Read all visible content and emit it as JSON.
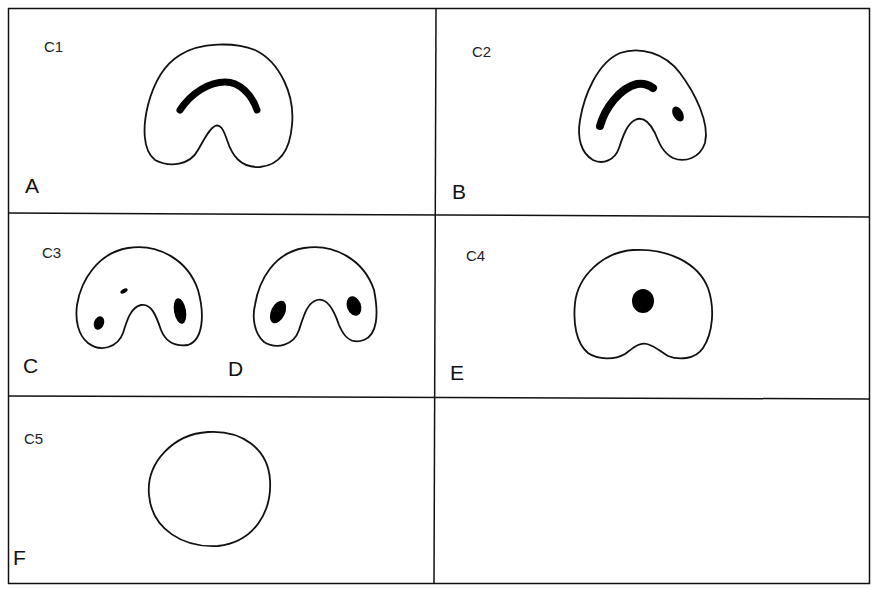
{
  "figure": {
    "panels": [
      {
        "id": "A",
        "letter": "A",
        "code": "C1",
        "description": "U-shaped outline with single curved crescent lesion along upper arch"
      },
      {
        "id": "B",
        "letter": "B",
        "code": "C2",
        "description": "U-shaped outline with elongated left lesion and small right oval lesion"
      },
      {
        "id": "C",
        "letter": "C",
        "code": "C3",
        "description": "U-shaped outline with three small separate lesions"
      },
      {
        "id": "D",
        "letter": "D",
        "code": "",
        "description": "U-shaped outline with two oval lesions, one on each limb"
      },
      {
        "id": "E",
        "letter": "E",
        "code": "C4",
        "description": "Rounded kidney outline with single central round lesion"
      },
      {
        "id": "F",
        "letter": "F",
        "code": "C5",
        "description": "Oval outline with no lesion"
      }
    ],
    "empty_panel": true,
    "colors": {
      "line": "#111111",
      "fill": "#ffffff",
      "lesion": "#000000"
    }
  }
}
